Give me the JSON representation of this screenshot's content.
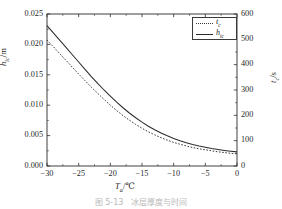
{
  "chart_data": {
    "type": "line",
    "title": "",
    "xlabel": "T_a/°C",
    "xlabel_parts": {
      "sym": "T",
      "sub": "a",
      "unit": "/℃"
    },
    "ylabel_left": "h_ic/m",
    "ylabel_left_parts": {
      "sym": "h",
      "sub": "ic",
      "unit": "/m"
    },
    "ylabel_right": "t_c/s",
    "ylabel_right_parts": {
      "sym": "t",
      "sub": "c",
      "unit": "/s"
    },
    "xlim": [
      -30,
      0
    ],
    "ylim_left": [
      0.0,
      0.025
    ],
    "ylim_right": [
      0,
      600
    ],
    "xticks": [
      -30,
      -25,
      -20,
      -15,
      -10,
      -5,
      0
    ],
    "xticklabels": [
      "−30",
      "−25",
      "−20",
      "−15",
      "−10",
      "−5",
      "0"
    ],
    "yticks_left": [
      0.0,
      0.005,
      0.01,
      0.015,
      0.02,
      0.025
    ],
    "yticklabels_left": [
      "0.000",
      "0.005",
      "0.010",
      "0.015",
      "0.020",
      "0.025"
    ],
    "yticks_right": [
      0,
      100,
      200,
      300,
      400,
      500,
      600
    ],
    "yticklabels_right": [
      "0",
      "100",
      "200",
      "300",
      "400",
      "500",
      "600"
    ],
    "grid": false,
    "legend_position": "upper right",
    "series": [
      {
        "name": "t_c",
        "name_parts": {
          "sym": "t",
          "sub": "c"
        },
        "style": "dotted",
        "color": "#3a3a3a",
        "axis": "right",
        "x": [
          -30,
          -29,
          -28,
          -27,
          -26,
          -25,
          -24,
          -23,
          -22,
          -21,
          -20,
          -19,
          -18,
          -17,
          -16,
          -15,
          -14,
          -13,
          -12,
          -11,
          -10,
          -9,
          -8,
          -7,
          -6,
          -5,
          -4,
          -3,
          -2,
          -1,
          0
        ],
        "values": [
          497,
          471,
          444,
          417,
          390,
          363,
          337,
          311,
          287,
          263,
          240,
          219,
          199,
          181,
          164,
          149,
          135,
          123,
          112,
          102,
          93,
          86,
          79,
          73,
          68,
          64,
          60,
          56,
          53,
          50,
          48
        ]
      },
      {
        "name": "h_ic",
        "name_parts": {
          "sym": "h",
          "sub": "ic"
        },
        "style": "solid",
        "color": "#2d2d2d",
        "axis": "left",
        "x": [
          -30,
          -29,
          -28,
          -27,
          -26,
          -25,
          -24,
          -23,
          -22,
          -21,
          -20,
          -19,
          -18,
          -17,
          -16,
          -15,
          -14,
          -13,
          -12,
          -11,
          -10,
          -9,
          -8,
          -7,
          -6,
          -5,
          -4,
          -3,
          -2,
          -1,
          0
        ],
        "values": [
          0.0231,
          0.0219,
          0.0207,
          0.0195,
          0.0183,
          0.0171,
          0.0159,
          0.0147,
          0.0136,
          0.0125,
          0.0115,
          0.0105,
          0.00958,
          0.00872,
          0.00793,
          0.00721,
          0.00655,
          0.00596,
          0.00543,
          0.00496,
          0.00454,
          0.00417,
          0.00384,
          0.00355,
          0.0033,
          0.00308,
          0.00288,
          0.00271,
          0.00256,
          0.00243,
          0.00232
        ]
      }
    ]
  },
  "legend": {
    "items": [
      {
        "label_sym": "t",
        "label_sub": "c",
        "style": "dotted"
      },
      {
        "label_sym": "h",
        "label_sub": "ic",
        "style": "solid"
      }
    ]
  },
  "caption": {
    "text": "图 5-13　冰层厚度与时间"
  }
}
